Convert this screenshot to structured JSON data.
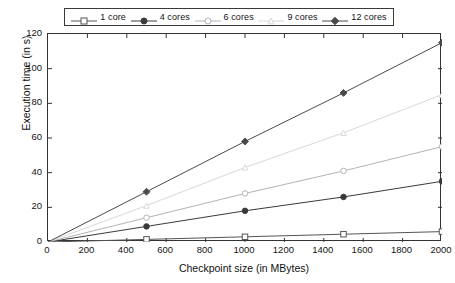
{
  "chart_data": {
    "type": "line",
    "title": "",
    "subtitle": "",
    "xlabel": "Checkpoint size (in MBytes)",
    "ylabel": "Execution time (in s)",
    "xlim": [
      0,
      2000
    ],
    "ylim": [
      0,
      120
    ],
    "xticks": [
      0,
      200,
      400,
      600,
      800,
      1000,
      1200,
      1400,
      1600,
      1800,
      2000
    ],
    "xtick_labels": [
      "0",
      "200",
      "400",
      "600",
      "800",
      "1000",
      "1200",
      "1400",
      "1600",
      "1800",
      "2000"
    ],
    "yticks": [
      0,
      20,
      40,
      60,
      80,
      100,
      120
    ],
    "ytick_labels": [
      "0",
      "20",
      "40",
      "60",
      "80",
      "100",
      "120"
    ],
    "grid": false,
    "legend_position": "top-outside",
    "x": [
      0,
      500,
      1000,
      1500,
      2000
    ],
    "series": [
      {
        "name": "1 core",
        "label": "1 core",
        "marker": "open-square",
        "color": "#555555",
        "values": [
          0,
          1.5,
          3.0,
          4.5,
          6.0
        ]
      },
      {
        "name": "4 cores",
        "label": "4 cores",
        "marker": "filled-circle",
        "color": "#3a3a3a",
        "values": [
          0,
          9.0,
          18.0,
          26.0,
          35.0
        ]
      },
      {
        "name": "6 cores",
        "label": "6 cores",
        "marker": "open-circle",
        "color": "#b4b4b4",
        "values": [
          0,
          14.0,
          28.0,
          41.0,
          55.0
        ]
      },
      {
        "name": "9 cores",
        "label": "9 cores",
        "marker": "open-triangle",
        "color": "#d8d8d8",
        "values": [
          0,
          21.0,
          43.0,
          63.0,
          85.0
        ]
      },
      {
        "name": "12 cores",
        "label": "12 cores",
        "marker": "filled-diamond",
        "color": "#4a4a4a",
        "values": [
          0,
          29.0,
          58.0,
          86.0,
          115.0
        ]
      }
    ]
  },
  "legend": {
    "entries": [
      {
        "label": "1 core"
      },
      {
        "label": "4 cores"
      },
      {
        "label": "6 cores"
      },
      {
        "label": "9 cores"
      },
      {
        "label": "12 cores"
      }
    ]
  },
  "axes": {
    "x_title": "Checkpoint size (in MBytes)",
    "y_title": "Execution time (in s)"
  }
}
